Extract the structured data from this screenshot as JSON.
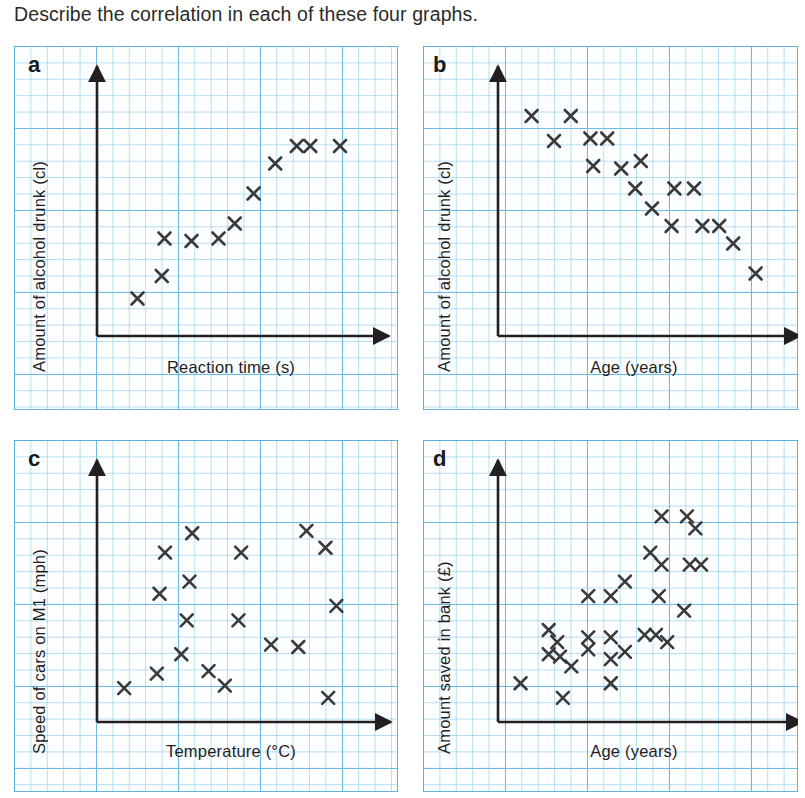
{
  "question": "Describe the correlation in each of these four graphs.",
  "colors": {
    "grid_minor": "#78c3e6",
    "grid_major": "#5aafdc",
    "axis": "#231f20",
    "marker": "#3a3a3a",
    "text": "#231f20",
    "paper": "#fdfeff"
  },
  "panels": [
    {
      "letter": "a",
      "ylabel": "Amount of alcohol drunk (cl)",
      "xlabel": "Reaction time (s)",
      "chart_data": {
        "type": "scatter",
        "title": "a",
        "xlabel": "Reaction time (s)",
        "ylabel": "Amount of alcohol drunk (cl)",
        "correlation": "positive",
        "grid": true,
        "legend": "none",
        "xlim": [
          0,
          100
        ],
        "ylim": [
          0,
          100
        ],
        "axis_ticks": "none",
        "points": [
          {
            "x": 15,
            "y": 15
          },
          {
            "x": 24,
            "y": 24
          },
          {
            "x": 25,
            "y": 39
          },
          {
            "x": 35,
            "y": 38
          },
          {
            "x": 45,
            "y": 39
          },
          {
            "x": 51,
            "y": 45
          },
          {
            "x": 58,
            "y": 57
          },
          {
            "x": 66,
            "y": 69
          },
          {
            "x": 74,
            "y": 76
          },
          {
            "x": 79,
            "y": 76
          },
          {
            "x": 90,
            "y": 76
          }
        ]
      }
    },
    {
      "letter": "b",
      "ylabel": "Amount of alcohol drunk (cl)",
      "xlabel": "Age (years)",
      "chart_data": {
        "type": "scatter",
        "title": "b",
        "xlabel": "Age (years)",
        "ylabel": "Amount of alcohol drunk (cl)",
        "correlation": "negative",
        "grid": true,
        "legend": "none",
        "xlim": [
          0,
          100
        ],
        "ylim": [
          0,
          100
        ],
        "axis_ticks": "none",
        "points": [
          {
            "x": 12,
            "y": 88
          },
          {
            "x": 26,
            "y": 88
          },
          {
            "x": 20,
            "y": 78
          },
          {
            "x": 33,
            "y": 79
          },
          {
            "x": 39,
            "y": 79
          },
          {
            "x": 34,
            "y": 68
          },
          {
            "x": 44,
            "y": 67
          },
          {
            "x": 51,
            "y": 70
          },
          {
            "x": 49,
            "y": 59
          },
          {
            "x": 63,
            "y": 59
          },
          {
            "x": 70,
            "y": 59
          },
          {
            "x": 55,
            "y": 51
          },
          {
            "x": 62,
            "y": 44
          },
          {
            "x": 73,
            "y": 44
          },
          {
            "x": 79,
            "y": 44
          },
          {
            "x": 84,
            "y": 37
          },
          {
            "x": 92,
            "y": 25
          }
        ]
      }
    },
    {
      "letter": "c",
      "ylabel": "Speed of cars on M1 (mph)",
      "xlabel": "Temperature (°C)",
      "chart_data": {
        "type": "scatter",
        "title": "c",
        "xlabel": "Temperature (°C)",
        "ylabel": "Speed of cars on M1 (mph)",
        "correlation": "none",
        "grid": true,
        "legend": "none",
        "xlim": [
          0,
          100
        ],
        "ylim": [
          0,
          100
        ],
        "axis_ticks": "none",
        "points": [
          {
            "x": 10,
            "y": 14
          },
          {
            "x": 22,
            "y": 20
          },
          {
            "x": 23,
            "y": 53
          },
          {
            "x": 25,
            "y": 70
          },
          {
            "x": 31,
            "y": 28
          },
          {
            "x": 33,
            "y": 42
          },
          {
            "x": 34,
            "y": 58
          },
          {
            "x": 35,
            "y": 78
          },
          {
            "x": 41,
            "y": 21
          },
          {
            "x": 47,
            "y": 15
          },
          {
            "x": 52,
            "y": 42
          },
          {
            "x": 53,
            "y": 70
          },
          {
            "x": 64,
            "y": 32
          },
          {
            "x": 74,
            "y": 31
          },
          {
            "x": 77,
            "y": 79
          },
          {
            "x": 84,
            "y": 72
          },
          {
            "x": 88,
            "y": 48
          },
          {
            "x": 85,
            "y": 10
          }
        ]
      }
    },
    {
      "letter": "d",
      "ylabel": "Amount saved in bank (£)",
      "xlabel": "Age (years)",
      "chart_data": {
        "type": "scatter",
        "title": "d",
        "xlabel": "Age (years)",
        "ylabel": "Amount saved in bank (£)",
        "correlation": "positive",
        "grid": true,
        "legend": "none",
        "xlim": [
          0,
          100
        ],
        "ylim": [
          0,
          100
        ],
        "axis_ticks": "none",
        "points": [
          {
            "x": 8,
            "y": 16
          },
          {
            "x": 18,
            "y": 28
          },
          {
            "x": 18,
            "y": 38
          },
          {
            "x": 21,
            "y": 33
          },
          {
            "x": 22,
            "y": 27
          },
          {
            "x": 23,
            "y": 10
          },
          {
            "x": 26,
            "y": 23
          },
          {
            "x": 32,
            "y": 30
          },
          {
            "x": 32,
            "y": 35
          },
          {
            "x": 32,
            "y": 52
          },
          {
            "x": 40,
            "y": 16
          },
          {
            "x": 40,
            "y": 26
          },
          {
            "x": 40,
            "y": 35
          },
          {
            "x": 40,
            "y": 52
          },
          {
            "x": 45,
            "y": 29
          },
          {
            "x": 45,
            "y": 58
          },
          {
            "x": 52,
            "y": 36
          },
          {
            "x": 56,
            "y": 36
          },
          {
            "x": 54,
            "y": 70
          },
          {
            "x": 57,
            "y": 52
          },
          {
            "x": 58,
            "y": 65
          },
          {
            "x": 58,
            "y": 85
          },
          {
            "x": 60,
            "y": 33
          },
          {
            "x": 66,
            "y": 46
          },
          {
            "x": 67,
            "y": 85
          },
          {
            "x": 68,
            "y": 65
          },
          {
            "x": 72,
            "y": 65
          },
          {
            "x": 70,
            "y": 80
          }
        ]
      }
    }
  ]
}
